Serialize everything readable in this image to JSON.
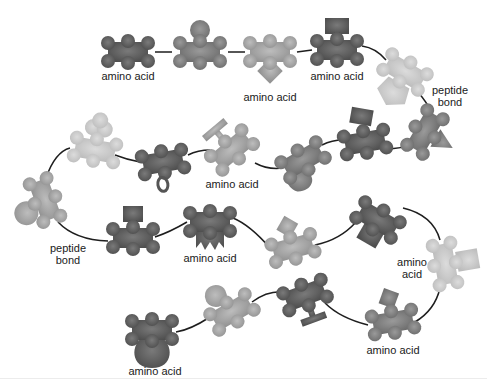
{
  "diagram": {
    "colors": {
      "dark": "#5e5e5e",
      "mid": "#7f7f7f",
      "light": "#a8a8a8",
      "pale": "#cfcfcf",
      "bond": "#1e1e1e",
      "text": "#1a1a1a"
    },
    "labels": {
      "aa1": "amino acid",
      "aa2": "amino acid",
      "aa3": "amino acid",
      "bond1_line1": "peptide",
      "bond1_line2": "bond",
      "aa4": "amino acid",
      "bond2_line1": "peptide",
      "bond2_line2": "bond",
      "aa5": "amino acid",
      "aa6_line1": "amino",
      "aa6_line2": "acid",
      "aa7": "amino acid",
      "aa8": "amino acid"
    },
    "amino_acids": [
      {
        "id": 1,
        "x": 128,
        "y": 52,
        "shade": "dark",
        "side_chain": "none",
        "label": "aa1"
      },
      {
        "id": 2,
        "x": 200,
        "y": 50,
        "shade": "mid",
        "side_chain": "circle-top"
      },
      {
        "id": 3,
        "x": 270,
        "y": 55,
        "shade": "light",
        "side_chain": "diamond-bottom",
        "label": "aa2"
      },
      {
        "id": 4,
        "x": 337,
        "y": 48,
        "shade": "dark",
        "side_chain": "rect-top",
        "label": "aa3"
      },
      {
        "id": 5,
        "x": 405,
        "y": 75,
        "shade": "pale",
        "side_chain": "pentagon-bottom"
      },
      {
        "id": 6,
        "x": 425,
        "y": 130,
        "shade": "mid",
        "side_chain": "triangle-right"
      },
      {
        "id": 7,
        "x": 365,
        "y": 140,
        "shade": "dark",
        "side_chain": "rect-top"
      },
      {
        "id": 8,
        "x": 303,
        "y": 158,
        "shade": "mid",
        "side_chain": "heart-bottom"
      },
      {
        "id": 9,
        "x": 232,
        "y": 148,
        "shade": "light",
        "side_chain": "T-top",
        "label": "aa4"
      },
      {
        "id": 10,
        "x": 163,
        "y": 162,
        "shade": "dark",
        "side_chain": "loop-bottom"
      },
      {
        "id": 11,
        "x": 95,
        "y": 148,
        "shade": "pale",
        "side_chain": "cloud-top"
      },
      {
        "id": 12,
        "x": 43,
        "y": 200,
        "shade": "light",
        "side_chain": "circle-left"
      },
      {
        "id": 13,
        "x": 133,
        "y": 237,
        "shade": "dark",
        "side_chain": "rect-top"
      },
      {
        "id": 14,
        "x": 210,
        "y": 228,
        "shade": "dark",
        "side_chain": "zigzag-bottom",
        "label": "aa5"
      },
      {
        "id": 15,
        "x": 293,
        "y": 248,
        "shade": "light",
        "side_chain": "diamond-top"
      },
      {
        "id": 16,
        "x": 378,
        "y": 222,
        "shade": "dark",
        "side_chain": "square-bottom"
      },
      {
        "id": 17,
        "x": 445,
        "y": 262,
        "shade": "pale",
        "side_chain": "rect-right",
        "label": "aa6"
      },
      {
        "id": 18,
        "x": 393,
        "y": 320,
        "shade": "mid",
        "side_chain": "diamond-top",
        "label": "aa7"
      },
      {
        "id": 19,
        "x": 305,
        "y": 300,
        "shade": "dark",
        "side_chain": "T-bottom"
      },
      {
        "id": 20,
        "x": 230,
        "y": 310,
        "shade": "light",
        "side_chain": "circle-top"
      },
      {
        "id": 21,
        "x": 153,
        "y": 335,
        "shade": "dark",
        "side_chain": "bulb-bottom",
        "label": "aa8"
      }
    ]
  }
}
